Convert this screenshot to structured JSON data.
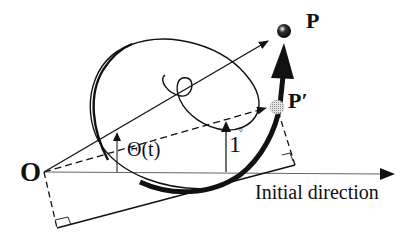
{
  "diagram": {
    "labels": {
      "origin": "O",
      "point_p": "P",
      "point_p_prime": "P′",
      "angle": "Θ(t)",
      "unit_angle": "1",
      "degree_mark": "°",
      "axis": "Initial direction"
    },
    "elements": {
      "origin_point": {
        "x": 44,
        "y": 172
      },
      "p_ball": {
        "x": 284,
        "y": 31,
        "color": "#000000"
      },
      "p_prime_ball": {
        "x": 277,
        "y": 107,
        "color": "#b0b0b0"
      },
      "axis_arrow_end": {
        "x": 392,
        "y": 174
      }
    },
    "colors": {
      "ink": "#111111",
      "axis": "#555555",
      "p_prime_fill": "#bdbdbd"
    }
  }
}
